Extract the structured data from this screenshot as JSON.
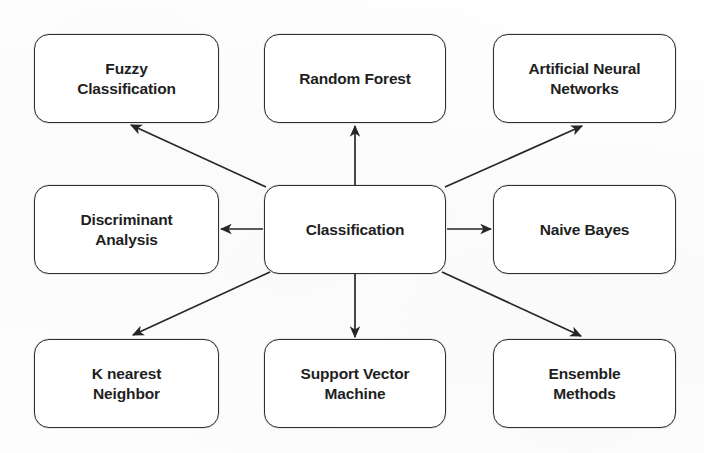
{
  "diagram": {
    "type": "radial-hub-and-spoke",
    "background_color": "#fdfdfd",
    "node_border_color": "#2e2e2e",
    "node_fill_color": "#ffffff",
    "text_color": "#1f1f1f",
    "edge_color": "#262626",
    "center": {
      "id": "classification",
      "label": "Classification"
    },
    "nodes": [
      {
        "id": "fuzzy-classification",
        "label": "Fuzzy\nClassification",
        "position": "top-left"
      },
      {
        "id": "random-forest",
        "label": "Random Forest",
        "position": "top-center"
      },
      {
        "id": "artificial-neural-networks",
        "label": "Artificial Neural\nNetworks",
        "position": "top-right"
      },
      {
        "id": "discriminant-analysis",
        "label": "Discriminant\nAnalysis",
        "position": "middle-left"
      },
      {
        "id": "naive-bayes",
        "label": "Naive Bayes",
        "position": "middle-right"
      },
      {
        "id": "k-nearest-neighbor",
        "label": "K nearest\nNeighbor",
        "position": "bottom-left"
      },
      {
        "id": "support-vector-machine",
        "label": "Support Vector\nMachine",
        "position": "bottom-center"
      },
      {
        "id": "ensemble-methods",
        "label": "Ensemble\nMethods",
        "position": "bottom-right"
      }
    ],
    "edges": [
      {
        "from": "classification",
        "to": "fuzzy-classification",
        "style": "single-arrow-diagonal"
      },
      {
        "from": "classification",
        "to": "random-forest",
        "style": "single-arrow-vertical"
      },
      {
        "from": "classification",
        "to": "artificial-neural-networks",
        "style": "single-arrow-diagonal"
      },
      {
        "from": "classification",
        "to": "discriminant-analysis",
        "style": "single-arrow-horizontal"
      },
      {
        "from": "classification",
        "to": "naive-bayes",
        "style": "single-arrow-horizontal"
      },
      {
        "from": "classification",
        "to": "k-nearest-neighbor",
        "style": "single-arrow-diagonal"
      },
      {
        "from": "classification",
        "to": "support-vector-machine",
        "style": "single-arrow-vertical"
      },
      {
        "from": "classification",
        "to": "ensemble-methods",
        "style": "single-arrow-diagonal"
      }
    ]
  }
}
